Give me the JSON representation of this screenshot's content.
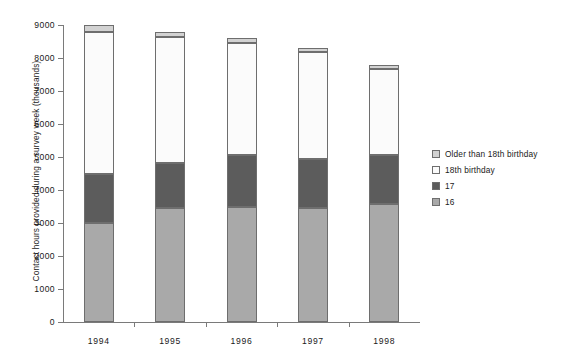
{
  "chart_data": {
    "type": "bar",
    "subtype": "stacked-vertical",
    "title": "",
    "xlabel": "",
    "ylabel": "Contact hours provided during a survey week (thousands)",
    "categories": [
      "1994",
      "1995",
      "1996",
      "1997",
      "1998"
    ],
    "ylim": [
      0,
      9000
    ],
    "yticks": [
      0,
      1000,
      2000,
      3000,
      4000,
      5000,
      6000,
      7000,
      8000,
      9000
    ],
    "ytick_labels": [
      "0",
      "1000",
      "2000",
      "3000",
      "4000",
      "5000",
      "6000",
      "7000",
      "8000",
      "9000"
    ],
    "grid": false,
    "legend_position": "right",
    "series": [
      {
        "name": "16",
        "color": "#a9a9a9",
        "values": [
          3000,
          3450,
          3500,
          3450,
          3570
        ]
      },
      {
        "name": "17",
        "color": "#5c5c5c",
        "values": [
          1500,
          1380,
          1550,
          1500,
          1480
        ]
      },
      {
        "name": "18th birthday",
        "color": "#fbfbfb",
        "values": [
          4300,
          3820,
          3400,
          3230,
          2630
        ]
      },
      {
        "name": "Older than 18th birthday",
        "color": "#d2d2d2",
        "values": [
          200,
          150,
          150,
          120,
          120
        ]
      }
    ],
    "totals": [
      9000,
      8800,
      8600,
      8300,
      7800
    ]
  },
  "legend": {
    "items": [
      {
        "label": "Older than 18th birthday",
        "color": "#d2d2d2"
      },
      {
        "label": "18th birthday",
        "color": "#fbfbfb"
      },
      {
        "label": "17",
        "color": "#5c5c5c"
      },
      {
        "label": "16",
        "color": "#a9a9a9"
      }
    ]
  },
  "colors": {
    "axis": "#7a7a7a",
    "segment_border": "#6e6e6e",
    "text": "#1a1a1a",
    "background": "#ffffff"
  }
}
